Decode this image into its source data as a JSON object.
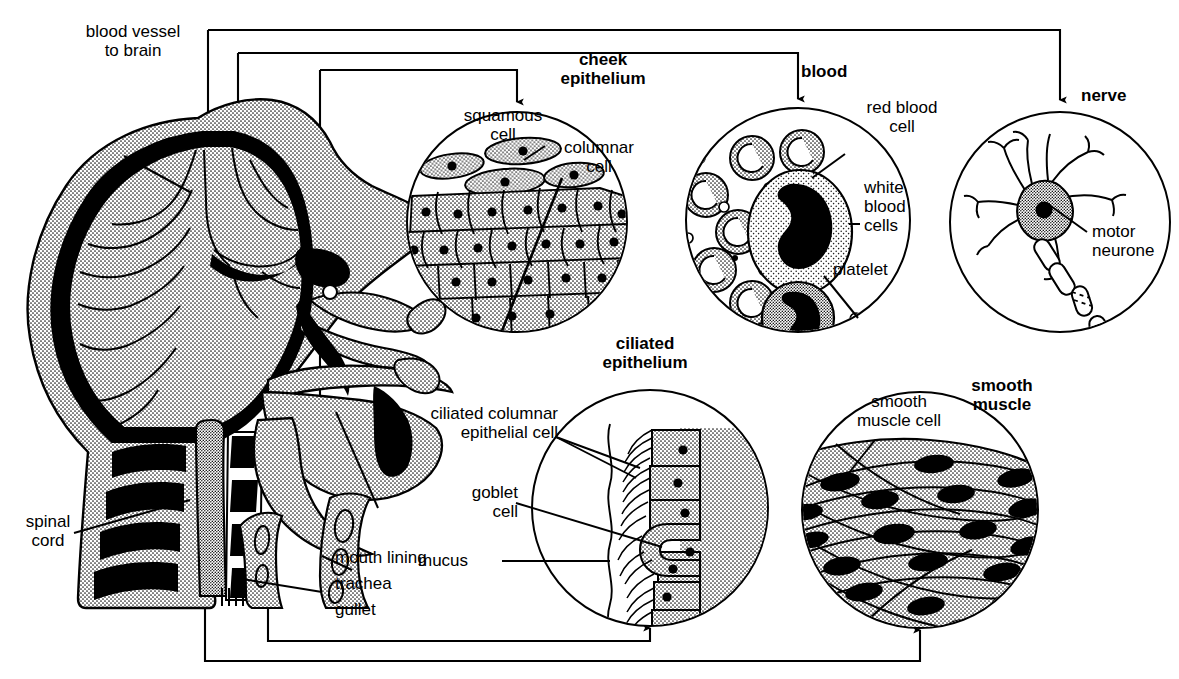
{
  "diagram": {
    "type": "biology-labelled-diagram",
    "background_color": "#ffffff",
    "ink_color": "#000000",
    "stipple_fill_color": "#d8d8d8"
  },
  "body_labels": {
    "blood_vessel": "blood vessel\nto brain",
    "spinal_cord": "spinal\ncord",
    "mouth_lining": "mouth lining",
    "trachea": "trachea",
    "gullet": "gullet"
  },
  "panels": [
    {
      "id": "cheek-epithelium",
      "title": "cheek\nepithelium",
      "title_bold": true,
      "labels": [
        "squamous\ncell",
        "columnar\ncell"
      ],
      "circle": {
        "cx": 517,
        "cy": 222,
        "r": 110
      }
    },
    {
      "id": "blood",
      "title": "blood",
      "title_bold": true,
      "labels": [
        "red blood\ncell",
        "white\nblood\ncells",
        "platelet"
      ],
      "circle": {
        "cx": 798,
        "cy": 220,
        "r": 112
      }
    },
    {
      "id": "nerve",
      "title": "nerve",
      "title_bold": true,
      "labels": [
        "motor\nneurone"
      ],
      "circle": {
        "cx": 1060,
        "cy": 222,
        "r": 110
      }
    },
    {
      "id": "ciliated-epithelium",
      "title": "ciliated\nepithelium",
      "title_bold": true,
      "labels": [
        "ciliated columnar\nepithelial cell",
        "goblet\ncell",
        "mucus"
      ],
      "circle": {
        "cx": 650,
        "cy": 508,
        "r": 118
      }
    },
    {
      "id": "smooth-muscle",
      "title": "smooth\nmuscle",
      "title_bold": true,
      "labels": [
        "smooth\nmuscle cell"
      ],
      "circle": {
        "cx": 920,
        "cy": 510,
        "r": 118
      }
    }
  ],
  "connectors": [
    {
      "from": "blood vessel in skull",
      "to": "blood panel arrow"
    },
    {
      "from": "skull top",
      "to": "nerve panel arrow"
    },
    {
      "from": "cheek region",
      "to": "cheek epithelium panel arrow"
    },
    {
      "from": "trachea",
      "to": "ciliated epithelium panel arrow"
    },
    {
      "from": "gullet",
      "to": "smooth muscle panel arrow"
    }
  ]
}
